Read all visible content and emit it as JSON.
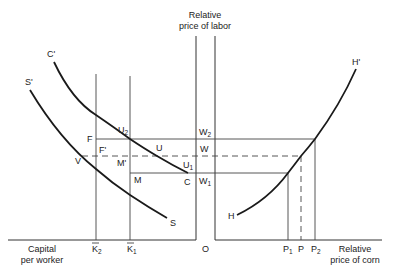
{
  "axes": {
    "left_x_label_line1": "Capital",
    "left_x_label_line2": "per worker",
    "right_x_label_line1": "Relative",
    "right_x_label_line2": "price of corn",
    "y_label_line1": "Relative",
    "y_label_line2": "price of labor",
    "origin_label": "O"
  },
  "ticks": {
    "k2": {
      "base": "K",
      "sub": "2"
    },
    "k1": {
      "base": "K",
      "sub": "1"
    },
    "p1": {
      "base": "P",
      "sub": "1"
    },
    "p": {
      "base": "P"
    },
    "p2": {
      "base": "P",
      "sub": "2"
    }
  },
  "curves": {
    "c_prime": "C'",
    "c": "C",
    "s_prime": "S'",
    "s": "S",
    "h": "H",
    "h_prime": "H'"
  },
  "points": {
    "f": "F",
    "f_prime": "F'",
    "v": "V",
    "m_prime": "M'",
    "m": "M",
    "u": "U",
    "u2": {
      "base": "U",
      "sub": "2"
    },
    "u1": {
      "base": "U",
      "sub": "1"
    },
    "w2": {
      "base": "W",
      "sub": "2"
    },
    "w": {
      "base": "W"
    },
    "w1": {
      "base": "W",
      "sub": "1"
    }
  },
  "colors": {
    "line": "#1a1a1a",
    "background": "#ffffff"
  }
}
